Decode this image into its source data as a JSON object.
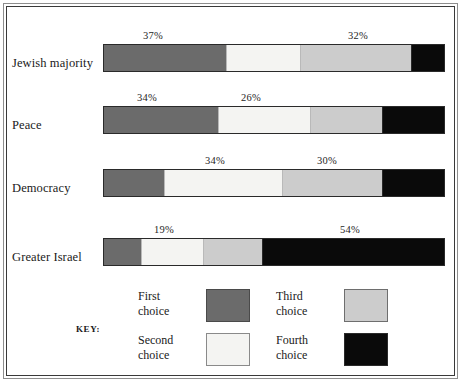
{
  "chart_data": {
    "type": "bar",
    "orientation": "horizontal",
    "stacked": true,
    "title": "",
    "subtitle": "",
    "xlabel": "",
    "ylabel": "",
    "xlim": [
      0,
      100
    ],
    "grid": false,
    "legend_position": "bottom",
    "legend_title": "KEY:",
    "unit": "%",
    "categories": [
      "Jewish majority",
      "Peace",
      "Democracy",
      "Greater Israel"
    ],
    "series": [
      {
        "name": "First choice",
        "color": "#6b6b6b",
        "values": [
          37,
          34,
          18,
          11
        ]
      },
      {
        "name": "Second choice",
        "color": "#f4f4f2",
        "values": [
          22,
          26,
          34,
          19
        ]
      },
      {
        "name": "Third choice",
        "color": "#cccccc",
        "values": [
          33,
          21,
          30,
          17
        ]
      },
      {
        "name": "Fourth choice",
        "color": "#0a0a0a",
        "values": [
          10,
          18,
          18,
          54
        ]
      }
    ],
    "annotations": [
      {
        "category": "Jewish majority",
        "series": "First choice",
        "label": "37%"
      },
      {
        "category": "Jewish majority",
        "series": "Third choice",
        "label": "32%"
      },
      {
        "category": "Peace",
        "series": "First choice",
        "label": "34%"
      },
      {
        "category": "Peace",
        "series": "Second choice",
        "label": "26%"
      },
      {
        "category": "Democracy",
        "series": "Second choice",
        "label": "34%"
      },
      {
        "category": "Democracy",
        "series": "Third choice",
        "label": "30%"
      },
      {
        "category": "Greater Israel",
        "series": "Second choice",
        "label": "19%"
      },
      {
        "category": "Greater Israel",
        "series": "Fourth choice",
        "label": "54%"
      }
    ]
  },
  "rows": [
    {
      "label": "Jewish majority",
      "segments": [
        {
          "name": "First choice",
          "pct": 36.0,
          "color": "#6b6b6b"
        },
        {
          "name": "Second choice",
          "pct": 21.6,
          "color": "#f4f4f2"
        },
        {
          "name": "Third choice",
          "pct": 32.7,
          "color": "#cccccc"
        },
        {
          "name": "Fourth choice",
          "pct": 9.7,
          "color": "#0a0a0a"
        }
      ],
      "labels": [
        {
          "text": "37%",
          "left": "143px"
        },
        {
          "text": "32%",
          "left": "348px"
        }
      ]
    },
    {
      "label": "Peace",
      "segments": [
        {
          "name": "First choice",
          "pct": 33.6,
          "color": "#6b6b6b"
        },
        {
          "name": "Second choice",
          "pct": 26.9,
          "color": "#f4f4f2"
        },
        {
          "name": "Third choice",
          "pct": 21.3,
          "color": "#cccccc"
        },
        {
          "name": "Fourth choice",
          "pct": 18.2,
          "color": "#0a0a0a"
        }
      ],
      "labels": [
        {
          "text": "34%",
          "left": "137px"
        },
        {
          "text": "26%",
          "left": "241px"
        }
      ]
    },
    {
      "label": "Democracy",
      "segments": [
        {
          "name": "First choice",
          "pct": 17.5,
          "color": "#6b6b6b"
        },
        {
          "name": "Second choice",
          "pct": 34.8,
          "color": "#f4f4f2"
        },
        {
          "name": "Third choice",
          "pct": 29.5,
          "color": "#cccccc"
        },
        {
          "name": "Fourth choice",
          "pct": 18.2,
          "color": "#0a0a0a"
        }
      ],
      "labels": [
        {
          "text": "34%",
          "left": "205px"
        },
        {
          "text": "30%",
          "left": "317px"
        }
      ]
    },
    {
      "label": "Greater Israel",
      "segments": [
        {
          "name": "First choice",
          "pct": 10.8,
          "color": "#6b6b6b"
        },
        {
          "name": "Second choice",
          "pct": 18.4,
          "color": "#f4f4f2"
        },
        {
          "name": "Third choice",
          "pct": 17.3,
          "color": "#cccccc"
        },
        {
          "name": "Fourth choice",
          "pct": 53.5,
          "color": "#0a0a0a"
        }
      ],
      "labels": [
        {
          "text": "19%",
          "left": "154px"
        },
        {
          "text": "54%",
          "left": "340px"
        }
      ]
    }
  ],
  "legend": {
    "key_label": "KEY:",
    "items": [
      {
        "line1": "First",
        "line2": "choice",
        "color": "#6b6b6b",
        "swatch_border": "#4a4a4a"
      },
      {
        "line1": "Third",
        "line2": "choice",
        "color": "#cccccc",
        "swatch_border": "#6e6e6e"
      },
      {
        "line1": "Second",
        "line2": "choice",
        "color": "#f4f4f2",
        "swatch_border": "#8a8a8a"
      },
      {
        "line1": "Fourth",
        "line2": "choice",
        "color": "#0a0a0a",
        "swatch_border": "#2a2a2a"
      }
    ]
  }
}
